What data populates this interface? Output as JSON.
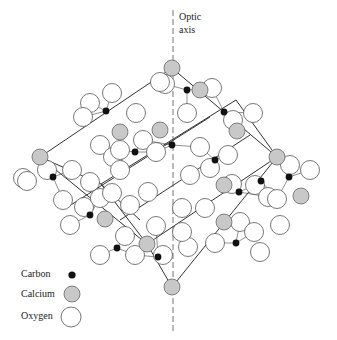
{
  "figure": {
    "axis_label_line1": "Optic",
    "axis_label_line2": "axis",
    "colors": {
      "line": "#333333",
      "carbon": "#111111",
      "calcium": "#c8c8c8",
      "oxygen": "#ffffff",
      "axis": "#666666"
    }
  },
  "legend": {
    "items": [
      {
        "label": "Carbon",
        "type": "carbon"
      },
      {
        "label": "Calcium",
        "type": "calcium"
      },
      {
        "label": "Oxygen",
        "type": "oxygen"
      }
    ]
  },
  "structure": {
    "edges": [
      [
        172,
        68,
        40,
        157
      ],
      [
        172,
        68,
        277,
        157
      ],
      [
        40,
        157,
        147,
        244
      ],
      [
        277,
        157,
        172,
        287
      ],
      [
        147,
        244,
        172,
        287
      ],
      [
        40,
        157,
        101,
        184
      ],
      [
        101,
        184,
        236,
        100
      ],
      [
        147,
        244,
        277,
        157
      ],
      [
        66,
        208,
        210,
        117
      ],
      [
        101,
        184,
        140,
        220
      ],
      [
        236,
        100,
        277,
        157
      ],
      [
        120,
        220,
        250,
        135
      ],
      [
        101,
        184,
        147,
        244
      ]
    ],
    "calcium": [
      [
        172,
        68
      ],
      [
        40,
        157
      ],
      [
        277,
        157
      ],
      [
        172,
        287
      ],
      [
        147,
        244
      ],
      [
        120,
        132
      ],
      [
        160,
        130
      ],
      [
        237,
        131
      ],
      [
        301,
        196
      ],
      [
        105,
        219
      ],
      [
        224,
        222
      ],
      [
        224,
        185
      ],
      [
        200,
        90
      ]
    ],
    "carbon": [
      [
        187,
        90
      ],
      [
        224,
        112
      ],
      [
        53,
        177
      ],
      [
        106,
        111
      ],
      [
        135,
        152
      ],
      [
        172,
        145
      ],
      [
        215,
        160
      ],
      [
        261,
        181
      ],
      [
        289,
        177
      ],
      [
        239,
        192
      ],
      [
        117,
        248
      ],
      [
        158,
        257
      ],
      [
        236,
        243
      ],
      [
        90,
        215
      ]
    ],
    "oxygen": [
      [
        165,
        84
      ],
      [
        212,
        88
      ],
      [
        187,
        113
      ],
      [
        233,
        120
      ],
      [
        253,
        113
      ],
      [
        160,
        82
      ],
      [
        112,
        93
      ],
      [
        90,
        103
      ],
      [
        83,
        117
      ],
      [
        136,
        113
      ],
      [
        100,
        145
      ],
      [
        113,
        157
      ],
      [
        47,
        170
      ],
      [
        23,
        178
      ],
      [
        72,
        170
      ],
      [
        90,
        182
      ],
      [
        120,
        170
      ],
      [
        143,
        140
      ],
      [
        156,
        152
      ],
      [
        120,
        150
      ],
      [
        200,
        147
      ],
      [
        228,
        155
      ],
      [
        232,
        184
      ],
      [
        255,
        185
      ],
      [
        268,
        197
      ],
      [
        290,
        165
      ],
      [
        310,
        170
      ],
      [
        277,
        199
      ],
      [
        280,
        225
      ],
      [
        125,
        236
      ],
      [
        135,
        255
      ],
      [
        100,
        255
      ],
      [
        163,
        255
      ],
      [
        188,
        247
      ],
      [
        215,
        243
      ],
      [
        240,
        222
      ],
      [
        254,
        232
      ],
      [
        260,
        252
      ],
      [
        84,
        207
      ],
      [
        70,
        225
      ],
      [
        148,
        192
      ],
      [
        130,
        205
      ],
      [
        156,
        226
      ],
      [
        182,
        232
      ],
      [
        182,
        208
      ],
      [
        190,
        175
      ],
      [
        210,
        168
      ],
      [
        205,
        208
      ],
      [
        27,
        181
      ],
      [
        100,
        198
      ],
      [
        112,
        193
      ],
      [
        63,
        200
      ]
    ]
  }
}
